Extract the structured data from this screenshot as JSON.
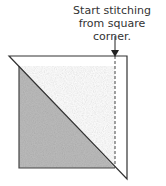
{
  "annotation": {
    "line1": "Start stitching",
    "line2": "from square corner."
  },
  "colors": {
    "fill": "#bdbdbd",
    "stroke": "#333333"
  }
}
